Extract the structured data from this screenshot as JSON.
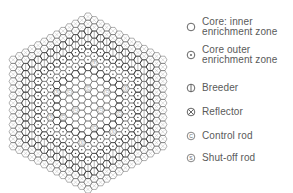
{
  "diagram": {
    "layout": {
      "center_x": 88,
      "center_y": 103,
      "pitch": 7.2,
      "rings": 12,
      "zones": [
        {
          "name": "inner",
          "max_ring": 5
        },
        {
          "name": "outer",
          "max_ring": 8
        },
        {
          "name": "breeder",
          "max_ring": 10
        },
        {
          "name": "reflector",
          "max_ring": 12
        }
      ],
      "control_rods": [
        [
          2,
          0
        ],
        [
          -2,
          2
        ],
        [
          0,
          -2
        ],
        [
          3,
          -3
        ],
        [
          -3,
          0
        ],
        [
          1,
          3
        ],
        [
          5,
          -1
        ],
        [
          -4,
          4
        ]
      ],
      "shutoff_rods": [
        [
          -5,
          1
        ],
        [
          6,
          -5
        ],
        [
          1,
          -6
        ],
        [
          -1,
          6
        ],
        [
          4,
          2
        ],
        [
          -6,
          5
        ]
      ]
    },
    "colors": {
      "line": "#5f5f5f",
      "zone_boundary": "#2f2f2f",
      "background": "#ffffff"
    }
  },
  "legend": {
    "items": [
      {
        "icon": "open-circle-icon",
        "label": "Core: inner\nenrichment zone",
        "top": 17
      },
      {
        "icon": "dotted-circle-icon",
        "label": "Core outer\nenrichment zone",
        "top": 45
      },
      {
        "icon": "vertical-bar-circle-icon",
        "label": "Breeder",
        "top": 83
      },
      {
        "icon": "x-circle-icon",
        "label": "Reflector",
        "top": 107
      },
      {
        "icon": "c-circle-icon",
        "label": "Control rod",
        "top": 131
      },
      {
        "icon": "s-circle-icon",
        "label": "Shut-off rod",
        "top": 153
      }
    ]
  }
}
